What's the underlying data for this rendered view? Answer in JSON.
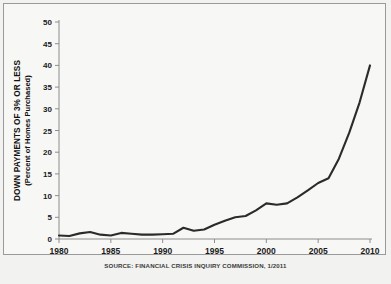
{
  "chart_data": {
    "type": "line",
    "title": "",
    "ylabel": "DOWN PAYMENTS OF 3% OR LESS",
    "ylabel_sub": "(Percent of Homes Purchased)",
    "xlabel": "",
    "xlim": [
      1980,
      2010
    ],
    "ylim": [
      0,
      50
    ],
    "grid": false,
    "legend": null,
    "y_ticks": [
      0,
      5,
      10,
      15,
      20,
      25,
      30,
      35,
      40,
      45,
      50
    ],
    "x_ticks": [
      1980,
      1985,
      1990,
      1995,
      2000,
      2005,
      2010
    ],
    "series": [
      {
        "name": "Down payments of 3% or less",
        "color": "#2b2b2b",
        "x": [
          1980,
          1981,
          1982,
          1983,
          1984,
          1985,
          1986,
          1987,
          1988,
          1989,
          1990,
          1991,
          1992,
          1993,
          1994,
          1995,
          1996,
          1997,
          1998,
          1999,
          2000,
          2001,
          2002,
          2003,
          2004,
          2005,
          2006,
          2007,
          2008,
          2009,
          2010
        ],
        "values": [
          0.8,
          0.7,
          1.3,
          1.6,
          1.0,
          0.8,
          1.4,
          1.2,
          1.0,
          1.0,
          1.1,
          1.2,
          2.6,
          1.9,
          2.2,
          3.3,
          4.2,
          5.0,
          5.3,
          6.6,
          8.2,
          7.9,
          8.2,
          9.6,
          11.2,
          12.9,
          14.0,
          18.5,
          24.5,
          31.5,
          40.0
        ]
      }
    ]
  },
  "source": {
    "text": "SOURCE: FINANCIAL CRISIS INQUIRY COMMISSION, 1/2011"
  },
  "colors": {
    "line": "#2b2b2b",
    "axis": "#8d8d8d",
    "background": "#f7f7f5",
    "border": "#9a9a9a"
  }
}
